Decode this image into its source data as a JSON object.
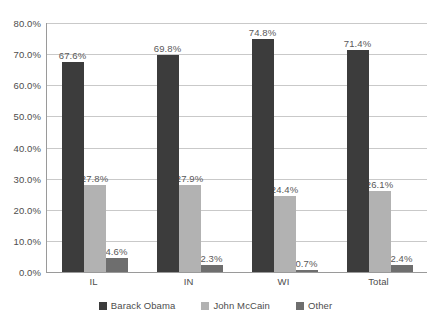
{
  "chart_data": {
    "type": "bar",
    "title": "",
    "xlabel": "",
    "ylabel": "",
    "categories": [
      "IL",
      "IN",
      "WI",
      "Total"
    ],
    "series": [
      {
        "name": "Barack Obama",
        "color": "#3c3c3c",
        "values": [
          67.6,
          69.8,
          74.8,
          71.4
        ],
        "labels": [
          "67.6%",
          "69.8%",
          "74.8%",
          "71.4%"
        ]
      },
      {
        "name": "John McCain",
        "color": "#b2b2b2",
        "values": [
          27.8,
          27.9,
          24.4,
          26.1
        ],
        "labels": [
          "27.8%",
          "27.9%",
          "24.4%",
          "26.1%"
        ]
      },
      {
        "name": "Other",
        "color": "#6e6e6e",
        "values": [
          4.6,
          2.3,
          0.7,
          2.4
        ],
        "labels": [
          "4.6%",
          "2.3%",
          "0.7%",
          "2.4%"
        ]
      }
    ],
    "ylim": [
      0,
      80
    ],
    "ytick_values": [
      0,
      10,
      20,
      30,
      40,
      50,
      60,
      70,
      80
    ],
    "ytick_labels": [
      "0.0%",
      "10.0%",
      "20.0%",
      "30.0%",
      "40.0%",
      "50.0%",
      "60.0%",
      "70.0%",
      "80.0%"
    ],
    "grid": "horizontal",
    "legend_position": "bottom",
    "legend": [
      "Barack Obama",
      "John McCain",
      "Other"
    ]
  },
  "colors": {
    "series_obama": "#3c3c3c",
    "series_mccain": "#b2b2b2",
    "series_other": "#6e6e6e",
    "gridline": "#c9c9c9",
    "axis": "#9a9a9a",
    "text": "#4d4d4d",
    "label_text": "#595959",
    "background": "#ffffff"
  }
}
